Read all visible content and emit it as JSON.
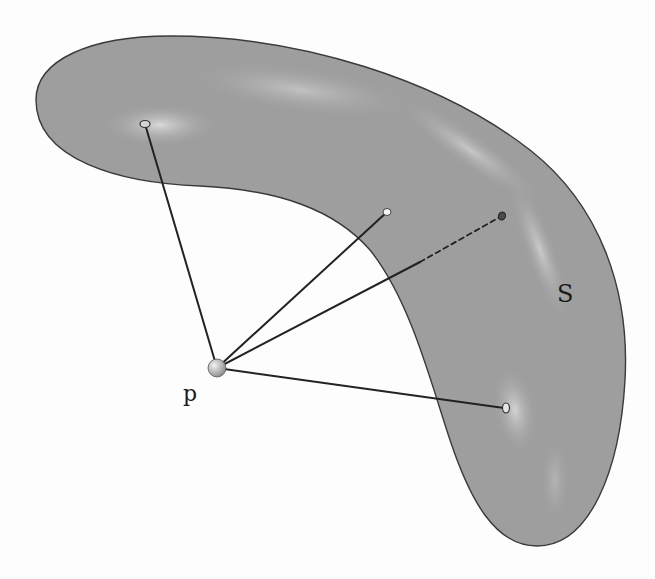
{
  "figure": {
    "surface_label": "S",
    "point_label": "p",
    "colors": {
      "background": "#fdfdfd",
      "surface_fill": "#9e9e9e",
      "surface_highlight": "#d8d8d8",
      "surface_outline": "#3a3a3a",
      "segment": "#222222",
      "point_p": "#b8b8b8"
    },
    "point_p": {
      "x": 217,
      "y": 368
    },
    "surface_points": [
      {
        "id": "q1",
        "x": 145,
        "y": 124,
        "style": "open"
      },
      {
        "id": "q2",
        "x": 387,
        "y": 212,
        "style": "open-light"
      },
      {
        "id": "q3",
        "x": 502,
        "y": 216,
        "style": "dark",
        "hidden_part_dashed": true
      },
      {
        "id": "q4",
        "x": 506,
        "y": 408,
        "style": "open"
      }
    ],
    "dashed_segment": {
      "from": {
        "x": 420,
        "y": 262
      },
      "to": {
        "x": 502,
        "y": 216
      }
    }
  }
}
